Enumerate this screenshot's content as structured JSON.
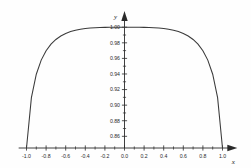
{
  "chart_data": {
    "type": "line",
    "title": "",
    "subtitle": "",
    "xlabel": "x",
    "ylabel": "y",
    "xlim": [
      -1.08,
      1.08
    ],
    "ylim": [
      0.845,
      1.008
    ],
    "grid": false,
    "legend": null,
    "x_ticks": [
      -1.0,
      -0.8,
      -0.6,
      -0.4,
      -0.2,
      0.0,
      0.2,
      0.4,
      0.6,
      0.8,
      1.0
    ],
    "x_tick_labels": [
      "-1.0",
      "-0.8",
      "-0.6",
      "-0.4",
      "-0.2",
      "0.0",
      "0.2",
      "0.4",
      "0.6",
      "0.8",
      "1.0"
    ],
    "x_minor_ticks": [
      -0.9,
      -0.7,
      -0.5,
      -0.3,
      -0.1,
      0.1,
      0.3,
      0.5,
      0.7,
      0.9
    ],
    "y_ticks": [
      0.86,
      0.88,
      0.9,
      0.92,
      0.94,
      0.96,
      0.98,
      1.0
    ],
    "y_tick_labels": [
      "0.86",
      "0.88",
      "0.90",
      "0.92",
      "0.94",
      "0.96",
      "0.98",
      "1.00"
    ],
    "y_minor_ticks": [
      0.87,
      0.89,
      0.91,
      0.93,
      0.95,
      0.97,
      0.99
    ],
    "series": [
      {
        "name": "curve",
        "color": "#3a3a3a",
        "x": [
          -1.0,
          -0.95,
          -0.9,
          -0.85,
          -0.8,
          -0.75,
          -0.7,
          -0.65,
          -0.6,
          -0.55,
          -0.5,
          -0.45,
          -0.4,
          -0.35,
          -0.3,
          -0.25,
          -0.2,
          -0.15,
          -0.1,
          -0.05,
          0.0,
          0.05,
          0.1,
          0.15,
          0.2,
          0.25,
          0.3,
          0.35,
          0.4,
          0.45,
          0.5,
          0.55,
          0.6,
          0.65,
          0.7,
          0.75,
          0.8,
          0.85,
          0.9,
          0.95,
          1.0
        ],
        "y": [
          0.8445,
          0.9096,
          0.9397,
          0.9578,
          0.9698,
          0.9782,
          0.9843,
          0.9887,
          0.992,
          0.9944,
          0.9961,
          0.9974,
          0.9983,
          0.9989,
          0.9993,
          0.9996,
          0.9998,
          0.9999,
          0.9999,
          1.0,
          1.0,
          1.0,
          0.9999,
          0.9999,
          0.9998,
          0.9996,
          0.9993,
          0.9989,
          0.9983,
          0.9974,
          0.9961,
          0.9944,
          0.992,
          0.9887,
          0.9843,
          0.9782,
          0.9698,
          0.9578,
          0.9397,
          0.9096,
          0.8445
        ]
      }
    ],
    "annotations": [],
    "axis_arrows": {
      "x_axis_arrow_at": 1.0,
      "y_axis_arrow_at": 1.005
    },
    "colors": {
      "background": "#fefefe",
      "axis": "#2a2a2a",
      "text": "#2b2b2b",
      "curve": "#3a3a3a"
    }
  }
}
